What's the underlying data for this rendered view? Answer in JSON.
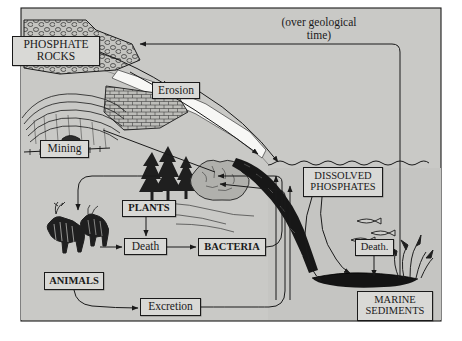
{
  "figure": {
    "background_color": "#c9c9c6",
    "frame_color": "#1a1a1a",
    "label_fill": "#d9d9d6",
    "ink_color": "#1a1a1a",
    "water_color": "#c2c2bf"
  },
  "annotations": {
    "geological_time": "(over geological\ntime)"
  },
  "labels": [
    {
      "id": "phosphate-rocks",
      "text": "PHOSPHATE\nROCKS",
      "x": 12,
      "y": 36,
      "w": 88,
      "h": 30,
      "size": 11.5,
      "weight": "normal",
      "caps": true
    },
    {
      "id": "erosion",
      "text": "Erosion",
      "x": 152,
      "y": 82,
      "w": 48,
      "h": 17,
      "size": 11.5,
      "weight": "normal",
      "caps": false
    },
    {
      "id": "mining",
      "text": "Mining",
      "x": 40,
      "y": 140,
      "w": 49,
      "h": 18,
      "size": 11.5,
      "weight": "normal",
      "caps": false
    },
    {
      "id": "plants",
      "text": "PLANTS",
      "x": 122,
      "y": 200,
      "w": 54,
      "h": 17,
      "size": 10.5,
      "weight": "bold",
      "caps": true
    },
    {
      "id": "death-land",
      "text": "Death",
      "x": 124,
      "y": 238,
      "w": 43,
      "h": 17,
      "size": 11.5,
      "weight": "normal",
      "caps": false
    },
    {
      "id": "bacteria",
      "text": "BACTERIA",
      "x": 198,
      "y": 238,
      "w": 68,
      "h": 18,
      "size": 10.5,
      "weight": "bold",
      "caps": true
    },
    {
      "id": "animals",
      "text": "ANIMALS",
      "x": 44,
      "y": 272,
      "w": 60,
      "h": 18,
      "size": 10.5,
      "weight": "bold",
      "caps": true
    },
    {
      "id": "excretion",
      "text": "Excretion",
      "x": 140,
      "y": 298,
      "w": 61,
      "h": 18,
      "size": 11.5,
      "weight": "normal",
      "caps": false
    },
    {
      "id": "dissolved-phosphates",
      "text": "DISSOLVED\nPHOSPHATES",
      "x": 303,
      "y": 167,
      "w": 80,
      "h": 30,
      "size": 10.5,
      "weight": "normal",
      "caps": true
    },
    {
      "id": "death-marine",
      "text": "Death.",
      "x": 355,
      "y": 239,
      "w": 39,
      "h": 17,
      "size": 10.5,
      "weight": "normal",
      "caps": false
    },
    {
      "id": "marine-sediments",
      "text": "MARINE\nSEDIMENTS",
      "x": 357,
      "y": 291,
      "w": 76,
      "h": 30,
      "size": 10.5,
      "weight": "normal",
      "caps": true
    }
  ],
  "scene_elements": [
    {
      "name": "phosphate-rock-outcrop",
      "kind": "rock-texture"
    },
    {
      "name": "open-pit-mine-terraces",
      "kind": "illustration"
    },
    {
      "name": "mine-cart",
      "kind": "illustration"
    },
    {
      "name": "eroding-hillside",
      "kind": "rock-texture"
    },
    {
      "name": "conifer-trees",
      "kind": "illustration"
    },
    {
      "name": "shrub",
      "kind": "illustration"
    },
    {
      "name": "deer-pair",
      "kind": "illustration"
    },
    {
      "name": "ocean-water",
      "kind": "water"
    },
    {
      "name": "coastal-sediment-band",
      "kind": "illustration"
    },
    {
      "name": "fish-group",
      "kind": "illustration"
    },
    {
      "name": "seaweed",
      "kind": "illustration"
    },
    {
      "name": "seafloor-sediment",
      "kind": "illustration"
    }
  ],
  "flow_arrows": [
    {
      "from": "marine-sediments",
      "to": "phosphate-rocks",
      "label": "(over geological time)"
    },
    {
      "from": "phosphate-rocks",
      "to": "erosion"
    },
    {
      "from": "erosion",
      "to": "dissolved-phosphates"
    },
    {
      "from": "mining",
      "to": "plants"
    },
    {
      "from": "plants",
      "to": "death-land"
    },
    {
      "from": "death-land",
      "to": "bacteria"
    },
    {
      "from": "animals",
      "to": "death-land"
    },
    {
      "from": "animals",
      "to": "excretion"
    },
    {
      "from": "bacteria",
      "to": "plants"
    },
    {
      "from": "excretion",
      "to": "plants"
    },
    {
      "from": "dissolved-phosphates",
      "to": "marine-sediments"
    },
    {
      "from": "dissolved-phosphates",
      "to": "death-marine"
    },
    {
      "from": "death-marine",
      "to": "marine-sediments"
    },
    {
      "from": "dissolved-phosphates",
      "to": "plants"
    }
  ]
}
